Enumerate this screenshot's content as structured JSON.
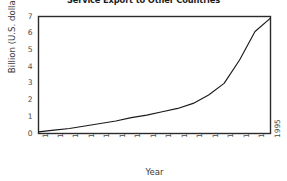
{
  "chart_data": {
    "type": "line",
    "title": "Service Export to Other Countries",
    "xlabel": "Year",
    "ylabel": "Billion (U.S. dollars)",
    "categories": [
      "1980",
      "1981",
      "1982",
      "1983",
      "1984",
      "1985",
      "1986",
      "1987",
      "1988",
      "1989",
      "1990",
      "1991",
      "1992",
      "1993",
      "1994",
      "1995"
    ],
    "x": [
      1980,
      1981,
      1982,
      1983,
      1984,
      1985,
      1986,
      1987,
      1988,
      1989,
      1990,
      1991,
      1992,
      1993,
      1994,
      1995
    ],
    "values": [
      0.1,
      0.2,
      0.3,
      0.45,
      0.6,
      0.75,
      0.95,
      1.1,
      1.3,
      1.5,
      1.8,
      2.3,
      3.0,
      4.4,
      6.1,
      6.9
    ],
    "ylim": [
      0,
      7
    ],
    "xlim": [
      1980,
      1995
    ],
    "yticks": [
      0,
      1,
      2,
      3,
      4,
      5,
      6,
      7
    ],
    "ytick_labels": [
      "0",
      "1",
      "2",
      "3",
      "4",
      "5",
      "6",
      "7"
    ],
    "grid": false,
    "legend": false,
    "series": [
      {
        "name": "Service Export",
        "values": [
          0.1,
          0.2,
          0.3,
          0.45,
          0.6,
          0.75,
          0.95,
          1.1,
          1.3,
          1.5,
          1.8,
          2.3,
          3.0,
          4.4,
          6.1,
          6.9
        ],
        "color": "#1a1a1a"
      }
    ],
    "style": {
      "line_color": "#1a1a1a",
      "frame_color": "#2b2b2b",
      "background": "#ffffff"
    }
  }
}
